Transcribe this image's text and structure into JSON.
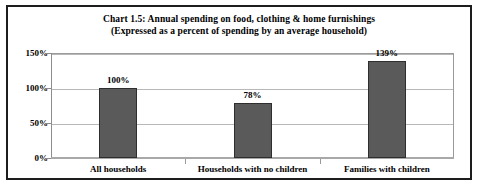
{
  "chart_data": {
    "type": "bar",
    "title": "Chart 1.5: Annual spending on food, clothing & home furnishings",
    "subtitle": "(Expressed as a percent of spending by an average household)",
    "categories": [
      "All households",
      "Households with no children",
      "Families with children"
    ],
    "values": [
      100,
      78,
      139
    ],
    "value_labels": [
      "100%",
      "78%",
      "139%"
    ],
    "xlabel": "",
    "ylabel": "",
    "ylim": [
      0,
      150
    ],
    "ytick_labels": [
      "0%",
      "50%",
      "100%",
      "150%"
    ],
    "ytick_values": [
      0,
      50,
      100,
      150
    ],
    "grid": true,
    "legend": false,
    "bar_color": "#5a5a5a",
    "bar_border_color": "#2e2e2e",
    "gridline_color": "#b8b8b8",
    "frame_color": "#1d1d1d",
    "axis_color": "#9a9a9a",
    "background": "#ffffff"
  }
}
